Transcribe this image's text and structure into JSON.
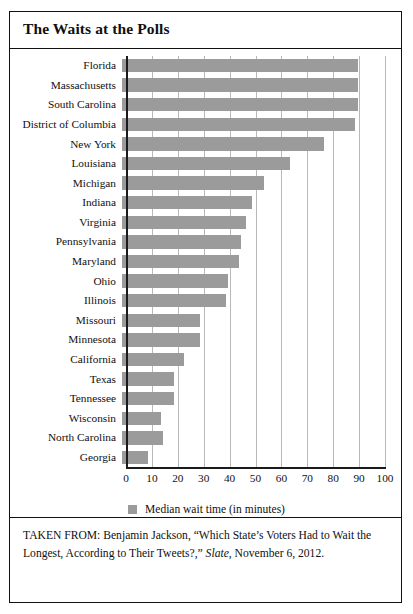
{
  "figure": {
    "title": "The Waits at the Polls",
    "source_prefix": "TAKEN FROM: Benjamin Jackson, “Which State’s Voters Had to Wait the Longest, According to Their Tweets?,” ",
    "source_publication": "Slate",
    "source_suffix": ", November 6, 2012."
  },
  "legend": {
    "label": "Median wait time (in minutes)",
    "swatch_color": "#9b9b9b"
  },
  "chart_data": {
    "type": "bar",
    "orientation": "horizontal",
    "title": "The Waits at the Polls",
    "xlabel": "",
    "ylabel": "",
    "xlim": [
      0,
      100
    ],
    "xticks": [
      0,
      10,
      20,
      30,
      40,
      50,
      60,
      70,
      80,
      90,
      100
    ],
    "grid": true,
    "grid_axis": "x",
    "legend_position": "bottom-center",
    "series_name": "Median wait time (in minutes)",
    "bar_color": "#9b9b9b",
    "categories": [
      "Florida",
      "Massachusetts",
      "South Carolina",
      "District of Columbia",
      "New York",
      "Louisiana",
      "Michigan",
      "Indiana",
      "Virginia",
      "Pennsylvania",
      "Maryland",
      "Ohio",
      "Illinois",
      "Missouri",
      "Minnesota",
      "California",
      "Texas",
      "Tennessee",
      "Wisconsin",
      "North Carolina",
      "Georgia"
    ],
    "values": [
      91,
      91,
      91,
      90,
      78,
      65,
      55,
      50,
      48,
      46,
      45,
      41,
      40,
      30,
      30,
      24,
      20,
      20,
      15,
      16,
      10
    ]
  }
}
